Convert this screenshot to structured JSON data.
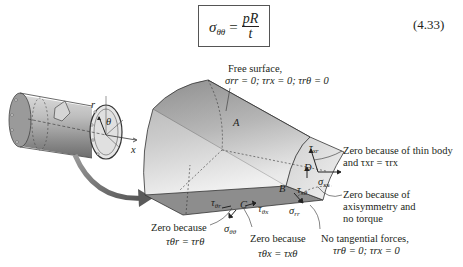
{
  "equation": {
    "lhs": "σ",
    "lhs_sub": "θθ",
    "equals": "=",
    "numerator": "pR",
    "denominator": "t",
    "number": "(4.33)"
  },
  "figure": {
    "cylinder_labels": {
      "r": "r",
      "theta": "θ",
      "x": "x"
    },
    "points": {
      "A": "A",
      "B": "B",
      "C": "C",
      "D": "D"
    },
    "stress_labels": {
      "tau_xr": "τ",
      "tau_xr_sub": "xr",
      "sigma_xx": "σ",
      "sigma_xx_sub": "xx",
      "tau_xtheta": "τ",
      "tau_xtheta_sub": "xθ",
      "sigma_rr": "σ",
      "sigma_rr_sub": "rr",
      "tau_thetar": "τ",
      "tau_thetar_sub": "θr",
      "tau_thetax": "τ",
      "tau_thetax_sub": "θx",
      "sigma_thetatheta": "σ",
      "sigma_thetatheta_sub": "θθ"
    },
    "annotations": {
      "free_surface_title": "Free surface,",
      "free_surface_cond": "σrr = 0; τrx = 0; τrθ = 0",
      "thin_body_line1": "Zero because of thin body",
      "thin_body_line2": "and τxr = τrx",
      "axisym_line1": "Zero because of",
      "axisym_line2": "axisymmetry and",
      "axisym_line3": "no torque",
      "no_tangential_line1": "No tangential forces,",
      "no_tangential_line2": "τrθ = 0; τrx = 0",
      "zero_thetar_line1": "Zero because",
      "zero_thetar_line2": "τθr = τrθ",
      "zero_thetax_line1": "Zero because",
      "zero_thetax_line2": "τθx = τxθ"
    }
  }
}
